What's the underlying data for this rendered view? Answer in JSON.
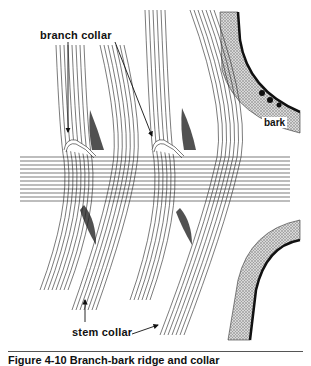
{
  "figure": {
    "labels": {
      "branch_collar": "branch collar",
      "stem_collar": "stem collar",
      "bark": "bark"
    },
    "caption": "Figure 4-10 Branch-bark ridge and collar",
    "colors": {
      "line": "#222222",
      "bark_fill": "#bdbdbd",
      "dark_shading": "#333333",
      "background": "#ffffff"
    }
  }
}
